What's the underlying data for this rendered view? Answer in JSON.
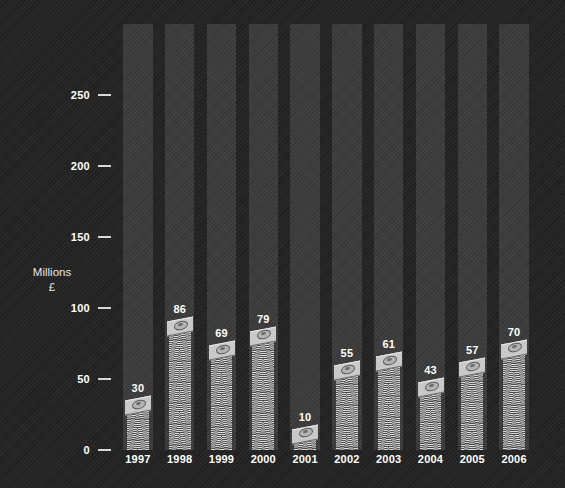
{
  "chart_data": {
    "type": "bar",
    "title": "",
    "xlabel": "",
    "ylabel": "Millions\n£",
    "ylabel_line1": "Millions",
    "ylabel_line2": "£",
    "categories": [
      "1997",
      "1998",
      "1999",
      "2000",
      "2001",
      "2002",
      "2003",
      "2004",
      "2005",
      "2006"
    ],
    "values": [
      30,
      86,
      69,
      79,
      10,
      55,
      61,
      43,
      57,
      70
    ],
    "ylim": [
      0,
      300
    ],
    "yticks": [
      0,
      50,
      100,
      150,
      200,
      250
    ],
    "ytick_labels": [
      "0",
      "50",
      "100",
      "150",
      "200",
      "250"
    ],
    "grid": false,
    "legend": null,
    "bar_style": "stacked-banknotes",
    "series": [
      {
        "name": "Millions £",
        "values": [
          30,
          86,
          69,
          79,
          10,
          55,
          61,
          43,
          57,
          70
        ]
      }
    ]
  },
  "style": {
    "background": "#272727",
    "band_color": "#3e3e3e",
    "bar_color": "#9d9d9d",
    "text_color": "#ffffff",
    "tick_color": "#d8d8d8"
  }
}
